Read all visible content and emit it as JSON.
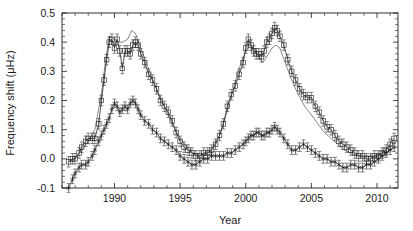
{
  "chart_data": {
    "type": "line",
    "title": "",
    "xlabel": "Year",
    "ylabel": "Frequency shift (μHz)",
    "xlim": [
      1986.0,
      2011.6
    ],
    "ylim": [
      -0.1,
      0.5
    ],
    "grid": false,
    "legend": "none",
    "x_ticks": [
      1990,
      1995,
      2000,
      2005,
      2010
    ],
    "x_tick_labels": [
      "1990",
      "1995",
      "2000",
      "2005",
      "2010"
    ],
    "y_ticks": [
      -0.1,
      0.0,
      0.1,
      0.2,
      0.3,
      0.4,
      0.5
    ],
    "y_tick_labels": [
      "-0.1",
      "0.0",
      "0.1",
      "0.2",
      "0.3",
      "0.4",
      "0.5"
    ],
    "x_minor_interval": 1,
    "y_minor_interval": 0.02,
    "series": [
      {
        "name": "high-frequency-shift",
        "marker": "square",
        "has_errorbars": true,
        "error": 0.018,
        "x": [
          1986.5,
          1986.8,
          1987.0,
          1987.3,
          1987.5,
          1987.8,
          1988.0,
          1988.3,
          1988.5,
          1988.8,
          1989.0,
          1989.2,
          1989.4,
          1989.6,
          1989.8,
          1990.0,
          1990.2,
          1990.4,
          1990.6,
          1990.8,
          1991.0,
          1991.2,
          1991.4,
          1991.6,
          1991.8,
          1992.0,
          1992.3,
          1992.6,
          1992.9,
          1993.2,
          1993.5,
          1993.8,
          1994.1,
          1994.4,
          1994.7,
          1995.0,
          1995.3,
          1995.6,
          1995.9,
          1996.2,
          1996.5,
          1996.8,
          1997.1,
          1997.4,
          1997.7,
          1998.0,
          1998.3,
          1998.6,
          1998.9,
          1999.2,
          1999.5,
          1999.8,
          2000.0,
          2000.2,
          2000.4,
          2000.6,
          2000.8,
          2001.0,
          2001.2,
          2001.4,
          2001.6,
          2001.8,
          2002.0,
          2002.2,
          2002.4,
          2002.6,
          2002.9,
          2003.2,
          2003.5,
          2003.8,
          2004.1,
          2004.4,
          2004.7,
          2005.0,
          2005.3,
          2005.6,
          2005.9,
          2006.2,
          2006.5,
          2006.8,
          2007.1,
          2007.4,
          2007.7,
          2008.0,
          2008.3,
          2008.6,
          2008.9,
          2009.2,
          2009.5,
          2009.8,
          2010.1,
          2010.4,
          2010.7,
          2011.0,
          2011.3
        ],
        "y": [
          -0.01,
          0.0,
          0.0,
          0.02,
          0.04,
          0.06,
          0.07,
          0.07,
          0.07,
          0.12,
          0.2,
          0.27,
          0.34,
          0.4,
          0.41,
          0.38,
          0.41,
          0.37,
          0.31,
          0.37,
          0.37,
          0.36,
          0.39,
          0.4,
          0.39,
          0.36,
          0.33,
          0.29,
          0.27,
          0.24,
          0.2,
          0.18,
          0.16,
          0.13,
          0.09,
          0.06,
          0.04,
          0.03,
          0.02,
          0.01,
          0.01,
          0.02,
          0.02,
          0.03,
          0.05,
          0.08,
          0.12,
          0.18,
          0.22,
          0.25,
          0.29,
          0.33,
          0.38,
          0.41,
          0.39,
          0.37,
          0.36,
          0.36,
          0.35,
          0.37,
          0.4,
          0.41,
          0.43,
          0.45,
          0.44,
          0.42,
          0.39,
          0.34,
          0.3,
          0.27,
          0.24,
          0.22,
          0.21,
          0.21,
          0.18,
          0.16,
          0.13,
          0.11,
          0.1,
          0.08,
          0.06,
          0.05,
          0.04,
          0.03,
          0.02,
          0.01,
          0.01,
          0.0,
          0.0,
          0.01,
          0.01,
          0.02,
          0.03,
          0.05,
          0.07
        ]
      },
      {
        "name": "low-frequency-shift",
        "marker": "star",
        "has_errorbars": true,
        "error": 0.015,
        "x": [
          1986.5,
          1986.8,
          1987.0,
          1987.3,
          1987.5,
          1987.8,
          1988.0,
          1988.3,
          1988.5,
          1988.8,
          1989.0,
          1989.2,
          1989.4,
          1989.6,
          1989.8,
          1990.0,
          1990.2,
          1990.4,
          1990.6,
          1990.8,
          1991.0,
          1991.2,
          1991.4,
          1991.6,
          1991.8,
          1992.0,
          1992.3,
          1992.6,
          1992.9,
          1993.2,
          1993.5,
          1993.8,
          1994.1,
          1994.4,
          1994.7,
          1995.0,
          1995.3,
          1995.6,
          1995.9,
          1996.2,
          1996.5,
          1996.8,
          1997.1,
          1997.4,
          1997.7,
          1998.0,
          1998.3,
          1998.6,
          1998.9,
          1999.2,
          1999.5,
          1999.8,
          2000.0,
          2000.2,
          2000.4,
          2000.6,
          2000.8,
          2001.0,
          2001.2,
          2001.4,
          2001.6,
          2001.8,
          2002.0,
          2002.2,
          2002.4,
          2002.6,
          2002.9,
          2003.2,
          2003.5,
          2003.8,
          2004.1,
          2004.4,
          2004.7,
          2005.0,
          2005.3,
          2005.6,
          2005.9,
          2006.2,
          2006.5,
          2006.8,
          2007.1,
          2007.4,
          2007.7,
          2008.0,
          2008.3,
          2008.6,
          2008.9,
          2009.2,
          2009.5,
          2009.8,
          2010.1,
          2010.4,
          2010.7,
          2011.0,
          2011.3
        ],
        "y": [
          -0.1,
          -0.07,
          -0.05,
          -0.03,
          -0.02,
          -0.02,
          -0.01,
          0.01,
          0.03,
          0.06,
          0.08,
          0.1,
          0.12,
          0.14,
          0.17,
          0.19,
          0.18,
          0.16,
          0.17,
          0.18,
          0.17,
          0.19,
          0.2,
          0.19,
          0.17,
          0.15,
          0.13,
          0.12,
          0.1,
          0.09,
          0.07,
          0.06,
          0.05,
          0.04,
          0.03,
          0.01,
          0.0,
          -0.01,
          -0.02,
          -0.02,
          -0.01,
          0.0,
          0.0,
          0.01,
          0.01,
          0.01,
          0.01,
          0.02,
          0.02,
          0.03,
          0.04,
          0.05,
          0.06,
          0.07,
          0.08,
          0.08,
          0.09,
          0.09,
          0.08,
          0.08,
          0.09,
          0.09,
          0.1,
          0.11,
          0.1,
          0.09,
          0.07,
          0.05,
          0.03,
          0.03,
          0.04,
          0.05,
          0.04,
          0.03,
          0.02,
          0.01,
          0.0,
          0.0,
          -0.01,
          -0.01,
          -0.02,
          -0.03,
          -0.03,
          -0.02,
          -0.02,
          -0.03,
          -0.03,
          -0.02,
          -0.02,
          -0.01,
          0.0,
          0.01,
          0.02,
          0.03,
          0.04
        ]
      }
    ],
    "smooth_curves": [
      {
        "name": "smooth-proxy-high",
        "x": [
          1986.5,
          1987.0,
          1987.5,
          1988.0,
          1988.5,
          1989.0,
          1989.3,
          1989.6,
          1990.0,
          1990.3,
          1990.6,
          1991.0,
          1991.3,
          1991.6,
          1992.0,
          1992.5,
          1993.0,
          1993.5,
          1994.0,
          1994.5,
          1995.0,
          1995.5,
          1996.0,
          1996.5,
          1997.0,
          1997.5,
          1998.0,
          1998.5,
          1999.0,
          1999.5,
          2000.0,
          2000.3,
          2000.6,
          2001.0,
          2001.3,
          2001.6,
          2002.0,
          2002.3,
          2002.6,
          2003.0,
          2003.5,
          2004.0,
          2004.5,
          2005.0,
          2005.5,
          2006.0,
          2006.5,
          2007.0,
          2007.5,
          2008.0,
          2008.5,
          2009.0,
          2009.5,
          2010.0,
          2010.5,
          2011.0,
          2011.3
        ],
        "y": [
          -0.01,
          0.0,
          0.03,
          0.06,
          0.1,
          0.22,
          0.33,
          0.42,
          0.41,
          0.4,
          0.4,
          0.41,
          0.44,
          0.43,
          0.38,
          0.32,
          0.26,
          0.21,
          0.16,
          0.11,
          0.07,
          0.04,
          0.02,
          0.01,
          0.02,
          0.04,
          0.08,
          0.15,
          0.23,
          0.31,
          0.37,
          0.39,
          0.38,
          0.35,
          0.33,
          0.35,
          0.38,
          0.39,
          0.38,
          0.33,
          0.27,
          0.22,
          0.18,
          0.15,
          0.12,
          0.09,
          0.07,
          0.05,
          0.03,
          0.02,
          0.01,
          0.01,
          0.01,
          0.01,
          0.02,
          0.03,
          0.04
        ]
      }
    ]
  },
  "axes": {
    "x_axis_title": "Year",
    "y_axis_title": "Frequency shift (μHz)"
  }
}
